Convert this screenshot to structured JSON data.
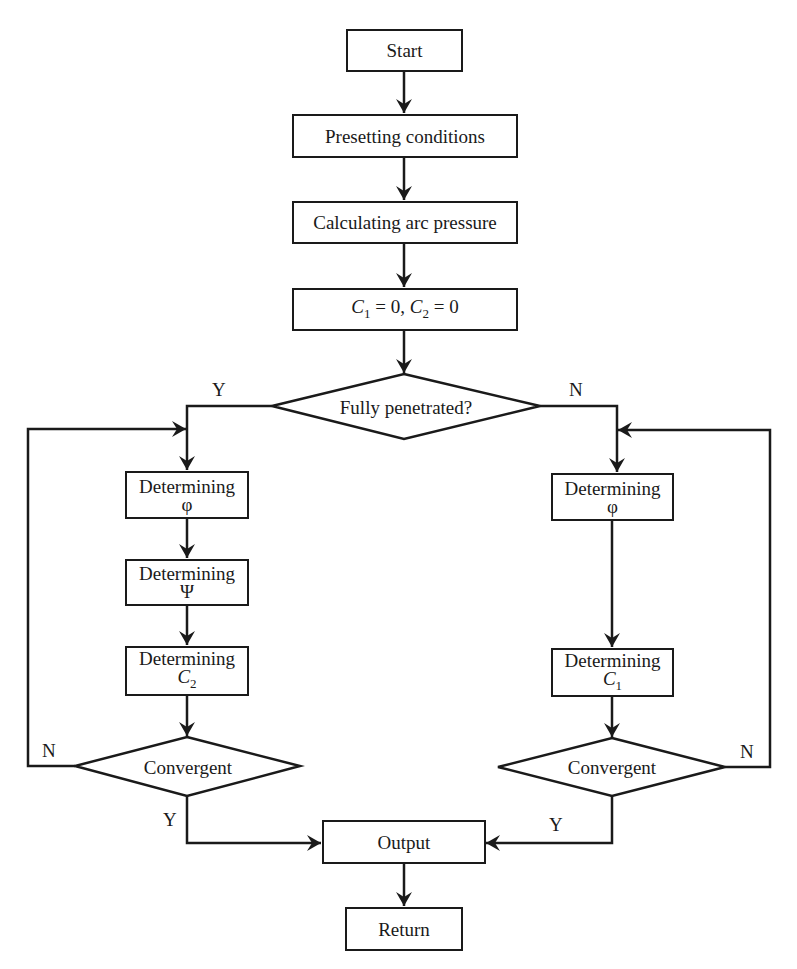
{
  "diagram": {
    "type": "flowchart",
    "nodes": {
      "start": "Start",
      "presetting": "Presetting conditions",
      "calculating": "Calculating arc pressure",
      "init": {
        "c1": "C",
        "c1_sub": "1",
        "c1_val": " = 0, ",
        "c2": "C",
        "c2_sub": "2",
        "c2_val": " = 0"
      },
      "decision_penetrated": "Fully penetrated?",
      "left": {
        "det_phi": {
          "label": "Determining",
          "symbol": "φ"
        },
        "det_psi": {
          "label": "Determining",
          "symbol": "Ψ"
        },
        "det_c2": {
          "label": "Determining",
          "symbol": "C",
          "sub": "2"
        },
        "convergent": "Convergent"
      },
      "right": {
        "det_phi": {
          "label": "Determining",
          "symbol": "φ"
        },
        "det_c1": {
          "label": "Determining",
          "symbol": "C",
          "sub": "1"
        },
        "convergent": "Convergent"
      },
      "output": "Output",
      "return": "Return"
    },
    "edge_labels": {
      "penetrated_yes": "Y",
      "penetrated_no": "N",
      "left_conv_no": "N",
      "left_conv_yes": "Y",
      "right_conv_no": "N",
      "right_conv_yes": "Y"
    },
    "colors": {
      "stroke": "#1a1a1a",
      "background": "#ffffff"
    }
  }
}
